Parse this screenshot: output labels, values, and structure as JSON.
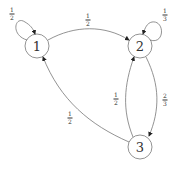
{
  "diagram": {
    "type": "markov-chain",
    "nodes": [
      {
        "id": "1",
        "label": "1",
        "x": 37,
        "y": 46
      },
      {
        "id": "2",
        "label": "2",
        "x": 140,
        "y": 46
      },
      {
        "id": "3",
        "label": "3",
        "x": 140,
        "y": 147
      }
    ],
    "edges": [
      {
        "from": "1",
        "to": "1",
        "num": "1",
        "den": "2",
        "label": "1/2"
      },
      {
        "from": "1",
        "to": "2",
        "num": "1",
        "den": "2",
        "label": "1/2"
      },
      {
        "from": "2",
        "to": "2",
        "num": "1",
        "den": "3",
        "label": "1/3"
      },
      {
        "from": "2",
        "to": "3",
        "num": "2",
        "den": "3",
        "label": "2/3"
      },
      {
        "from": "3",
        "to": "2",
        "num": "1",
        "den": "2",
        "label": "1/2"
      },
      {
        "from": "3",
        "to": "1",
        "num": "1",
        "den": "2",
        "label": "1/2"
      }
    ]
  }
}
